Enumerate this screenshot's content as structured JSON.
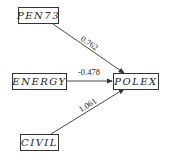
{
  "nodes": {
    "pen73": "PEN73",
    "energy": "ENERGY",
    "civil": "CIVIL",
    "polex": "POLEX"
  },
  "edges": {
    "pen73_polex": "0.762",
    "energy_polex": "-0.478",
    "civil_polex": "1.061"
  },
  "colors": {
    "line": "#333333",
    "background": "#ffffff"
  }
}
